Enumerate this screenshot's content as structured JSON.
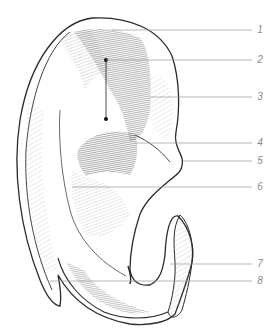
{
  "figure": {
    "style": "pencil hatching, grayscale",
    "colors": {
      "ink": "#2a2a2a",
      "shade": "#555555",
      "leader_line": "#9a9a9a",
      "label": "#8a8a8a",
      "background": "#ffffff"
    }
  },
  "callouts": [
    {
      "number": "1",
      "y": 30,
      "line_x1": 112,
      "line_x2": 252
    },
    {
      "number": "2",
      "y": 60,
      "line_x1": 106,
      "line_x2": 252
    },
    {
      "number": "3",
      "y": 97,
      "line_x1": 150,
      "line_x2": 252
    },
    {
      "number": "4",
      "y": 143,
      "line_x1": 135,
      "line_x2": 252
    },
    {
      "number": "5",
      "y": 161,
      "line_x1": 183,
      "line_x2": 252
    },
    {
      "number": "6",
      "y": 187,
      "line_x1": 72,
      "line_x2": 252
    },
    {
      "number": "7",
      "y": 264,
      "line_x1": 170,
      "line_x2": 252
    },
    {
      "number": "8",
      "y": 281,
      "line_x1": 50,
      "line_x2": 252
    }
  ],
  "markers": {
    "bracket_2_3": {
      "x": 106,
      "y_top": 60,
      "y_bottom": 119
    }
  }
}
